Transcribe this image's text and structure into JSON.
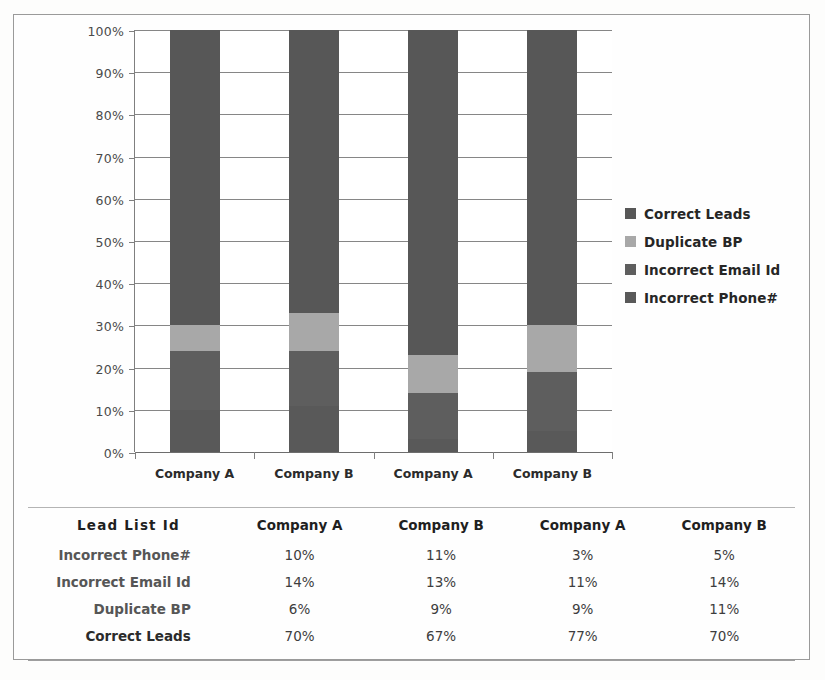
{
  "chart_data": {
    "type": "bar",
    "subtype": "100% stacked bar",
    "title": "",
    "xlabel": "",
    "ylabel": "",
    "ylim": [
      0,
      100
    ],
    "yticks": [
      "0%",
      "10%",
      "20%",
      "30%",
      "40%",
      "50%",
      "60%",
      "70%",
      "80%",
      "90%",
      "100%"
    ],
    "ytick_values": [
      0,
      10,
      20,
      30,
      40,
      50,
      60,
      70,
      80,
      90,
      100
    ],
    "grid": true,
    "legend_position": "right",
    "categories": [
      "Company A",
      "Company B",
      "Company A",
      "Company B"
    ],
    "series": [
      {
        "name": "Incorrect Phone#",
        "values": [
          10,
          11,
          3,
          5
        ],
        "color": "#595959"
      },
      {
        "name": "Incorrect Email Id",
        "values": [
          14,
          13,
          11,
          14
        ],
        "color": "#5e5e5e"
      },
      {
        "name": "Duplicate BP",
        "values": [
          6,
          9,
          9,
          11
        ],
        "color": "#a8a8a8"
      },
      {
        "name": "Correct Leads",
        "values": [
          70,
          67,
          77,
          70
        ],
        "color": "#575757"
      }
    ],
    "stack_order_bottom_to_top": [
      "Incorrect Phone#",
      "Incorrect Email Id",
      "Duplicate BP",
      "Correct Leads"
    ]
  },
  "legend": {
    "items": [
      {
        "label": "Correct Leads",
        "color": "#575757"
      },
      {
        "label": "Duplicate BP",
        "color": "#a8a8a8"
      },
      {
        "label": "Incorrect Email Id",
        "color": "#5e5e5e"
      },
      {
        "label": "Incorrect Phone#",
        "color": "#595959"
      }
    ]
  },
  "axis": {
    "y_labels": [
      "100%",
      "90%",
      "80%",
      "70%",
      "60%",
      "50%",
      "40%",
      "30%",
      "20%",
      "10%",
      "0%"
    ],
    "x_labels": [
      "Company A",
      "Company B",
      "Company A",
      "Company B"
    ]
  },
  "table": {
    "headers": [
      "Lead  List  Id",
      "Company A",
      "Company B",
      "Company A",
      "Company B"
    ],
    "rows": [
      {
        "label": "Incorrect Phone#",
        "values": [
          "10%",
          "11%",
          "3%",
          "5%"
        ]
      },
      {
        "label": "Incorrect Email Id",
        "values": [
          "14%",
          "13%",
          "11%",
          "14%"
        ]
      },
      {
        "label": "Duplicate BP",
        "values": [
          "6%",
          "9%",
          "9%",
          "11%"
        ]
      },
      {
        "label": "Correct Leads",
        "values": [
          "70%",
          "67%",
          "77%",
          "70%"
        ]
      }
    ]
  },
  "colors": {
    "dark_segment": "#595959",
    "light_segment": "#a8a8a8",
    "gridline": "#868686",
    "frame": "#9a9a9a",
    "background": "#fefefe"
  }
}
